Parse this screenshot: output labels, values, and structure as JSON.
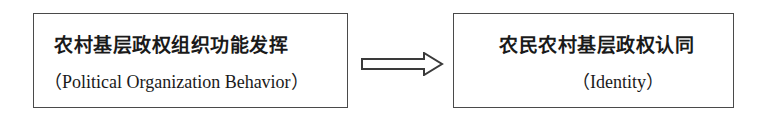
{
  "diagram": {
    "type": "flow",
    "nodes": [
      {
        "id": "left",
        "title": "农村基层政权组织功能发挥",
        "subtitle": "（Political Organization Behavior）"
      },
      {
        "id": "right",
        "title": "农民农村基层政权认同",
        "subtitle": "（Identity）"
      }
    ],
    "edges": [
      {
        "from": "left",
        "to": "right",
        "style": "hollow-double-arrow"
      }
    ],
    "colors": {
      "border": "#4a4a4a",
      "text": "#1a1a1a",
      "background": "#ffffff"
    }
  }
}
